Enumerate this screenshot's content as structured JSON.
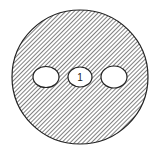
{
  "diagram": {
    "outer_circle": {
      "cx": 80,
      "cy": 77,
      "rx": 68,
      "ry": 67,
      "fill": "hatched",
      "stroke": "#222222"
    },
    "holes": [
      {
        "id": "left-hole",
        "cx": 46,
        "cy": 77,
        "rx": 13,
        "ry": 10.5,
        "label": ""
      },
      {
        "id": "center-hole",
        "cx": 80,
        "cy": 77,
        "rx": 12,
        "ry": 10,
        "label": "1"
      },
      {
        "id": "right-hole",
        "cx": 114,
        "cy": 77,
        "rx": 13,
        "ry": 11,
        "label": ""
      }
    ],
    "colors": {
      "line": "#222222",
      "hatch": "#444444",
      "background": "#ffffff"
    }
  }
}
